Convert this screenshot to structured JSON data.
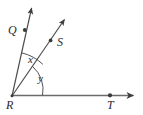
{
  "figure": {
    "type": "geometry-diagram",
    "width": 143,
    "height": 115,
    "background_color": "#ffffff",
    "stroke_color": "#4a4a4a",
    "label_color": "#2a2a2a"
  },
  "labels": {
    "vertex": "R",
    "point_q": "Q",
    "point_s": "S",
    "point_t": "T",
    "angle_x": "x",
    "angle_y": "y"
  },
  "geometry": {
    "vertex": {
      "name": "R",
      "x": 12,
      "y": 96
    },
    "rays": [
      {
        "name": "ray-RQ",
        "from": "R",
        "through_point": "Q",
        "point_marker": {
          "x": 25,
          "y": 30
        },
        "arrow_tip": {
          "x": 33,
          "y": 5
        },
        "label_position": {
          "x": 8,
          "y": 24
        }
      },
      {
        "name": "ray-RS",
        "from": "R",
        "through_point": "S",
        "point_marker": {
          "x": 51,
          "y": 40
        },
        "arrow_tip": {
          "x": 67,
          "y": 16
        },
        "label_position": {
          "x": 57,
          "y": 36
        }
      },
      {
        "name": "ray-RT",
        "from": "R",
        "through_point": "T",
        "point_marker": {
          "x": 110,
          "y": 95
        },
        "arrow_tip": {
          "x": 137,
          "y": 95
        },
        "label_position": {
          "x": 107,
          "y": 99
        }
      }
    ],
    "angles": [
      {
        "name": "angle-x",
        "label": "x",
        "between": [
          "ray-RQ",
          "ray-RS"
        ],
        "arc_radius": 44,
        "label_position": {
          "x": 28,
          "y": 54
        }
      },
      {
        "name": "angle-y",
        "label": "y",
        "between": [
          "ray-RS",
          "ray-RT"
        ],
        "arc_radius": 30,
        "label_position": {
          "x": 38,
          "y": 73
        }
      }
    ]
  }
}
